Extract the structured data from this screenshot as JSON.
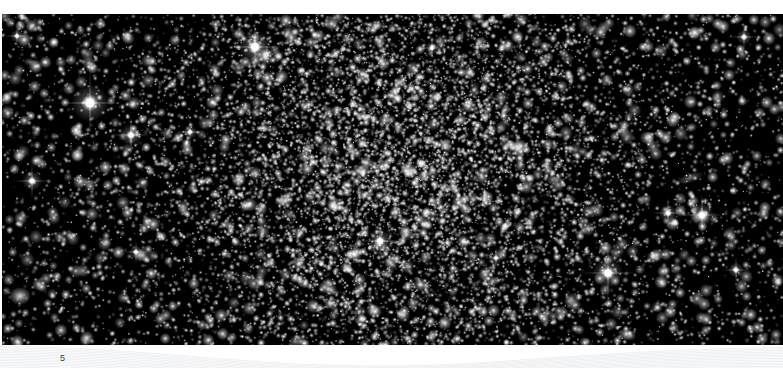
{
  "page": {
    "number": "5",
    "background_color": "#ffffff",
    "width": 783,
    "height": 368
  },
  "figure": {
    "name": "deep-field-star-cluster-photograph",
    "background_color": "#000000",
    "star_color": "#ffffff",
    "x": 2,
    "y": 14,
    "width": 781,
    "height": 331,
    "features": [
      {
        "type": "dense-cluster-core",
        "cx": 390,
        "cy": 150,
        "rx": 180,
        "ry": 175
      },
      {
        "type": "diffuse-galaxy",
        "cx": 20,
        "cy": 296,
        "rx": 11,
        "ry": 9
      },
      {
        "type": "edge-on-spiral-galaxy",
        "cx": 690,
        "cy": 178,
        "rx": 14,
        "ry": 5,
        "angle": -18
      },
      {
        "type": "elongated-galaxy",
        "cx": 474,
        "cy": 90,
        "rx": 5,
        "ry": 9,
        "angle": 20
      },
      {
        "type": "faint-galaxy",
        "cx": 358,
        "cy": 322,
        "rx": 8,
        "ry": 3,
        "angle": 55
      },
      {
        "type": "faint-galaxy",
        "cx": 30,
        "cy": 62,
        "rx": 7,
        "ry": 4,
        "angle": 10
      },
      {
        "type": "faint-galaxy",
        "cx": 547,
        "cy": 314,
        "rx": 7,
        "ry": 4,
        "angle": -25
      }
    ],
    "bright_stars": [
      {
        "cx": 90,
        "cy": 103,
        "size": 34
      },
      {
        "cx": 255,
        "cy": 47,
        "size": 30
      },
      {
        "cx": 131,
        "cy": 135,
        "size": 20
      },
      {
        "cx": 32,
        "cy": 181,
        "size": 18
      },
      {
        "cx": 608,
        "cy": 273,
        "size": 28
      },
      {
        "cx": 702,
        "cy": 215,
        "size": 22
      },
      {
        "cx": 380,
        "cy": 241,
        "size": 22
      },
      {
        "cx": 668,
        "cy": 213,
        "size": 16
      },
      {
        "cx": 744,
        "cy": 37,
        "size": 14
      },
      {
        "cx": 17,
        "cy": 36,
        "size": 12
      },
      {
        "cx": 736,
        "cy": 270,
        "size": 14
      },
      {
        "cx": 190,
        "cy": 132,
        "size": 13
      },
      {
        "cx": 496,
        "cy": 258,
        "size": 12
      },
      {
        "cx": 136,
        "cy": 252,
        "size": 12
      },
      {
        "cx": 432,
        "cy": 48,
        "size": 12
      }
    ]
  },
  "decoration": {
    "name": "swoosh-curves",
    "stroke_color": "#e9ebee",
    "curve_count": 16
  }
}
